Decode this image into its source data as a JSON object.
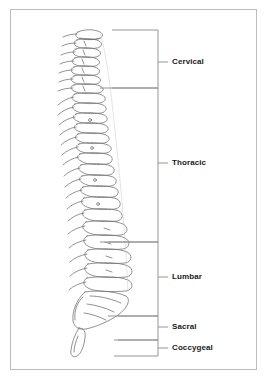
{
  "figure": {
    "view": "lateral",
    "background_color": "#ffffff",
    "frame_color": "#bcbcbc",
    "line_color": "#6e6e6e",
    "label_color": "#1a1a1a"
  },
  "diagram_data": {
    "type": "anatomical-diagram",
    "subject": "human vertebral column (spine), lateral view",
    "bracket_right_edge_x": 158,
    "tick_end_x": 168,
    "label_start_x": 172,
    "regions": [
      {
        "label": "Cervical",
        "top_y": 30,
        "bottom_y": 88,
        "tick_y": 62,
        "label_y": 62
      },
      {
        "label": "Thoracic",
        "top_y": 88,
        "bottom_y": 242,
        "tick_y": 163,
        "label_y": 163
      },
      {
        "label": "Lumbar",
        "top_y": 242,
        "bottom_y": 316,
        "tick_y": 277,
        "label_y": 277
      },
      {
        "label": "Sacral",
        "top_y": 316,
        "bottom_y": 340,
        "tick_y": 327,
        "label_y": 327
      },
      {
        "label": "Coccygeal",
        "top_y": 340,
        "bottom_y": 356,
        "tick_y": 348,
        "label_y": 348
      }
    ]
  }
}
